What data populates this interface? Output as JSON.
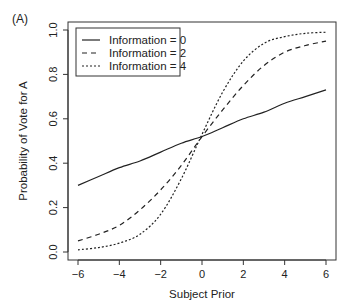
{
  "panel_label": "(A)",
  "chart_data": {
    "type": "line",
    "title": "",
    "xlabel": "Subject Prior",
    "ylabel": "Probability of Vote for A",
    "xlim": [
      -6,
      6
    ],
    "ylim": [
      0,
      1
    ],
    "xticks": [
      -6,
      -4,
      -2,
      0,
      2,
      4,
      6
    ],
    "xtick_labels": [
      "−6",
      "−4",
      "−2",
      "0",
      "2",
      "4",
      "6"
    ],
    "yticks": [
      0.0,
      0.2,
      0.4,
      0.6,
      0.8,
      1.0
    ],
    "ytick_labels": [
      "0.0",
      "0.2",
      "0.4",
      "0.6",
      "0.8",
      "1.0"
    ],
    "grid": false,
    "legend_position": "top-left",
    "x": [
      -6,
      -5,
      -4,
      -3,
      -2,
      -1,
      0,
      1,
      2,
      3,
      4,
      5,
      6
    ],
    "series": [
      {
        "name": "Information = 0",
        "style": "solid",
        "values": [
          0.3,
          0.34,
          0.38,
          0.41,
          0.45,
          0.49,
          0.52,
          0.56,
          0.6,
          0.63,
          0.67,
          0.7,
          0.73
        ]
      },
      {
        "name": "Information = 2",
        "style": "dashed",
        "values": [
          0.05,
          0.08,
          0.12,
          0.19,
          0.28,
          0.39,
          0.52,
          0.64,
          0.75,
          0.84,
          0.9,
          0.93,
          0.95
        ]
      },
      {
        "name": "Information = 4",
        "style": "dotted",
        "values": [
          0.01,
          0.02,
          0.04,
          0.08,
          0.17,
          0.33,
          0.53,
          0.72,
          0.86,
          0.94,
          0.97,
          0.985,
          0.99
        ]
      }
    ]
  },
  "legend": {
    "items": [
      {
        "label": "Information = 0"
      },
      {
        "label": "Information = 2"
      },
      {
        "label": "Information = 4"
      }
    ]
  }
}
